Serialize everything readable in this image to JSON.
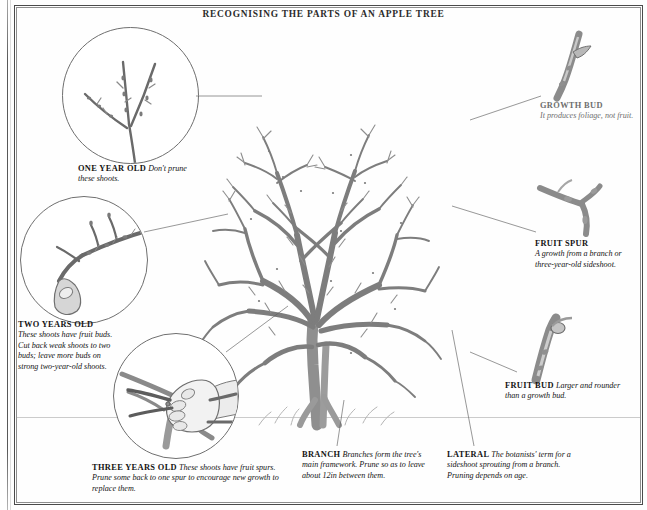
{
  "title": "RECOGNISING THE PARTS OF AN APPLE TREE",
  "captions": {
    "one_year": {
      "label": "ONE YEAR OLD",
      "text": "Don't prune these shoots."
    },
    "two_years": {
      "label": "TWO YEARS OLD",
      "text": "These shoots have fruit buds. Cut back weak shoots to two buds; leave more buds on strong two-year-old shoots."
    },
    "three_years": {
      "label": "THREE YEARS OLD",
      "text": "These shoots have fruit spurs. Prune some back to one spur to encourage new growth to replace them."
    },
    "branch": {
      "label": "BRANCH",
      "text": "Branches form the tree's main framework. Prune so as to leave about 12in between them."
    },
    "lateral": {
      "label": "LATERAL",
      "text": "The botanists' term for a sideshoot sprouting from a branch. Pruning depends on age."
    },
    "growth_bud": {
      "label": "GROWTH BUD",
      "text": "It produces foliage, not fruit."
    },
    "fruit_spur": {
      "label": "FRUIT SPUR",
      "text": "A growth from a branch or three-year-old sideshoot."
    },
    "fruit_bud": {
      "label": "FRUIT BUD",
      "text": "Larger and rounder than a growth bud."
    }
  },
  "illustrations": {
    "main_tree": "bare-apple-tree-drawing",
    "vignette_one_year": "one-year-old-shoots-detail",
    "vignette_two_years": "two-year-old-shoot-with-buds-detail",
    "vignette_three_years": "hand-pruning-with-secateurs-detail",
    "inset_growth_bud": "growth-bud-twig-detail",
    "inset_fruit_spur": "fruit-spur-detail",
    "inset_fruit_bud": "fruit-bud-twig-detail"
  },
  "colors": {
    "ink": "#1a1a1a",
    "graphite": "#6a6a6a",
    "frame": "#4a4a4a",
    "paper": "#fefefe"
  }
}
